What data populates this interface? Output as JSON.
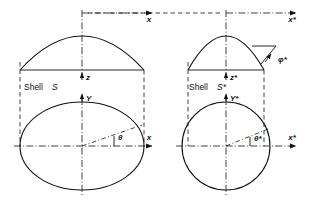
{
  "figure": {
    "background_color": "#ffffff",
    "line_color": "#111111"
  },
  "left_shell": {
    "caption_word": "Shell",
    "caption_symbol": "S",
    "elevation": {
      "description": "shallow dome meridian profile",
      "axis_vertical_label": "z",
      "axis_horizontal_label": "x"
    },
    "plan": {
      "description": "ellipse plan view",
      "axis_vertical_label": "Y",
      "axis_horizontal_label": "x",
      "angle_label": "θ"
    }
  },
  "right_shell": {
    "caption_word": "Shell",
    "caption_symbol": "S*",
    "elevation": {
      "description": "steep dome meridian profile",
      "axis_vertical_label": "z*",
      "axis_horizontal_label": "x*",
      "angle_label": "φ*"
    },
    "plan": {
      "description": "circle plan view",
      "axis_vertical_label": "Y*",
      "axis_horizontal_label": "x*",
      "angle_label": "θ*"
    }
  }
}
